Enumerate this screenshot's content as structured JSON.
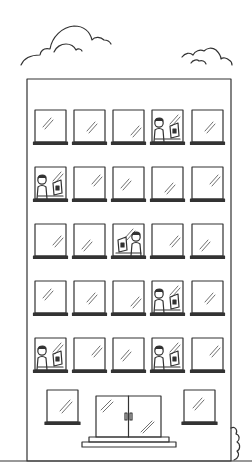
{
  "scene": {
    "description": "Line-art illustration of a multi-story office building with clouds",
    "stroke_color": "#333333",
    "background": "#ffffff"
  },
  "building": {
    "floors": 5,
    "windows_per_floor": 5,
    "occupied_windows": [
      {
        "row": 0,
        "col": 3,
        "layout": "person-left"
      },
      {
        "row": 1,
        "col": 0,
        "layout": "person-left"
      },
      {
        "row": 2,
        "col": 2,
        "layout": "person-right"
      },
      {
        "row": 3,
        "col": 3,
        "layout": "person-left"
      },
      {
        "row": 4,
        "col": 0,
        "layout": "person-left"
      },
      {
        "row": 4,
        "col": 3,
        "layout": "person-left"
      }
    ],
    "entrance": {
      "type": "double-glass-door",
      "steps": 2
    }
  },
  "clouds": 2
}
